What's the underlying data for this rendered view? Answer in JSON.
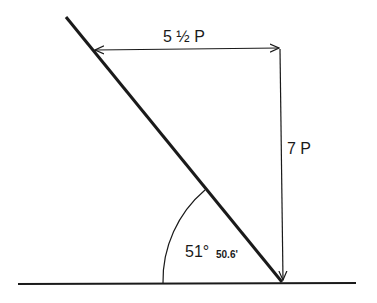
{
  "labels": {
    "horizontal": "5 ½ P",
    "vertical": "7 P",
    "angle_deg": "51°",
    "angle_min": "50.6'"
  },
  "colors": {
    "ink": "#1a1a1a",
    "background": "#ffffff"
  }
}
